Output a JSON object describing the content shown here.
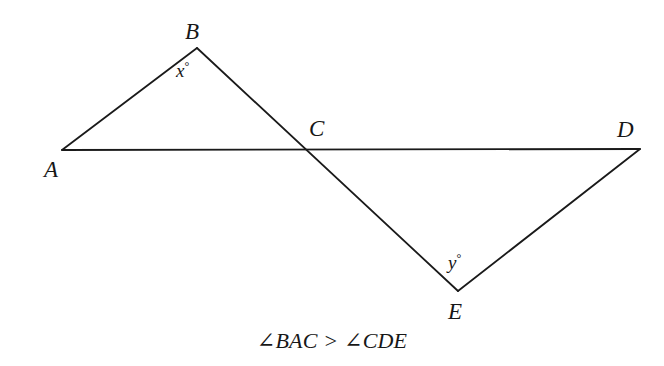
{
  "figure": {
    "type": "geometry-diagram",
    "background_color": "#ffffff",
    "stroke_color": "#1a1a1a",
    "stroke_width": 1.8,
    "canvas": {
      "width": 664,
      "height": 366
    },
    "points": {
      "A": {
        "x": 62,
        "y": 150
      },
      "B": {
        "x": 197,
        "y": 48
      },
      "C": {
        "x": 303,
        "y": 148
      },
      "D": {
        "x": 640,
        "y": 149
      },
      "E": {
        "x": 458,
        "y": 291
      }
    },
    "segments": [
      {
        "name": "AD",
        "from": "A",
        "to": "D",
        "description": "horizontal transversal line from A through C to D"
      },
      {
        "name": "AB",
        "from": "A",
        "to": "B",
        "description": "upper left side of triangle ABC"
      },
      {
        "name": "BE",
        "from": "B",
        "to": "E",
        "description": "straight line from B through intersection C down to E"
      },
      {
        "name": "ED",
        "from": "E",
        "to": "D",
        "description": "lower right side of triangle CDE"
      }
    ],
    "intersection": {
      "label": "C",
      "note": "segment AD crosses segment BE at point C"
    }
  },
  "labels": {
    "A": "A",
    "B": "B",
    "C": "C",
    "D": "D",
    "E": "E"
  },
  "angles": {
    "x": {
      "variable": "x",
      "degree_symbol": "°",
      "at_vertex": "B"
    },
    "y": {
      "variable": "y",
      "degree_symbol": "°",
      "at_vertex": "E"
    }
  },
  "caption": {
    "text": "∠BAC > ∠CDE",
    "angle_1": "∠BAC",
    "relation": ">",
    "angle_2": "∠CDE"
  }
}
